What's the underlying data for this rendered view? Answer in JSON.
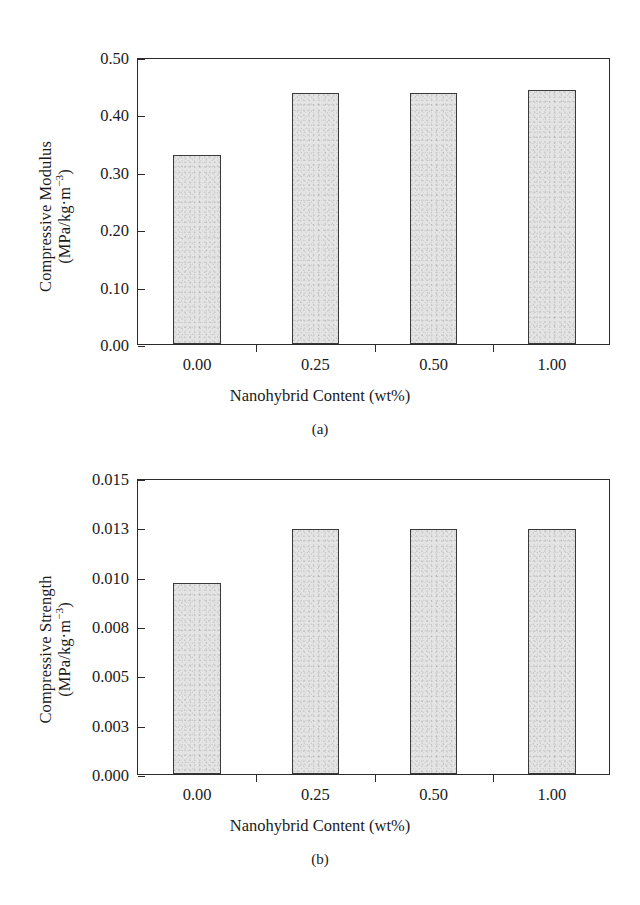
{
  "figure": {
    "background_color": "#ffffff",
    "bar_fill_color": "#e4e4e4",
    "bar_edge_color": "#3a3a3a",
    "axis_color": "#2b2b2b"
  },
  "panels": [
    {
      "id": "a",
      "subcaption": "(a)",
      "ylabel_line1": "Compressive Modulus",
      "ylabel_line2": "(MPa/kg·m⁻³)",
      "xlabel": "Nanohybrid Content (wt%)",
      "ytick_labels": [
        "0.00",
        "0.10",
        "0.20",
        "0.30",
        "0.40",
        "0.50"
      ],
      "xtick_labels": [
        "0.00",
        "0.25",
        "0.50",
        "1.00"
      ]
    },
    {
      "id": "b",
      "subcaption": "(b)",
      "ylabel_line1": "Compressive Strength",
      "ylabel_line2": "(MPa/kg·m⁻³)",
      "xlabel": "Nanohybrid Content (wt%)",
      "ytick_labels": [
        "0.000",
        "0.003",
        "0.005",
        "0.008",
        "0.010",
        "0.013",
        "0.015"
      ],
      "xtick_labels": [
        "0.00",
        "0.25",
        "0.50",
        "1.00"
      ]
    }
  ],
  "chart_data": [
    {
      "type": "bar",
      "panel": "a",
      "title": "",
      "xlabel": "Nanohybrid Content (wt%)",
      "ylabel": "Compressive Modulus (MPa/kg·m⁻³)",
      "categories": [
        "0.00",
        "0.25",
        "0.50",
        "1.00"
      ],
      "values": [
        0.33,
        0.438,
        0.437,
        0.443
      ],
      "ylim": [
        0.0,
        0.5
      ],
      "ytick_values": [
        0.0,
        0.1,
        0.2,
        0.3,
        0.4,
        0.5
      ],
      "grid": false,
      "legend": "none"
    },
    {
      "type": "bar",
      "panel": "b",
      "title": "",
      "xlabel": "Nanohybrid Content (wt%)",
      "ylabel": "Compressive Strength (MPa/kg·m⁻³)",
      "categories": [
        "0.00",
        "0.25",
        "0.50",
        "1.00"
      ],
      "values": [
        0.00968,
        0.0124,
        0.0124,
        0.0124
      ],
      "ylim": [
        0.0,
        0.015
      ],
      "ytick_values": [
        0.0,
        0.003,
        0.005,
        0.008,
        0.01,
        0.013,
        0.015
      ],
      "grid": false,
      "legend": "none"
    }
  ]
}
